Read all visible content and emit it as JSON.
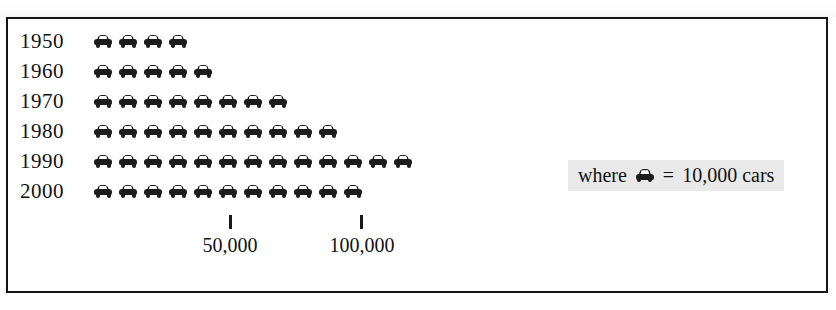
{
  "chart_data": {
    "type": "bar",
    "chart_style": "pictograph",
    "title": "",
    "xlabel": "",
    "ylabel": "",
    "categories": [
      "1950",
      "1960",
      "1970",
      "1980",
      "1990",
      "2000"
    ],
    "values": [
      40000,
      50000,
      80000,
      100000,
      130000,
      110000
    ],
    "icon_counts": [
      4,
      5,
      8,
      10,
      13,
      11
    ],
    "icon_unit_value": 10000,
    "icon_name": "car-icon",
    "axis_ticks": [
      {
        "label": "50,000",
        "value": 50000
      },
      {
        "label": "100,000",
        "value": 100000
      }
    ],
    "xlim": [
      0,
      140000
    ],
    "grid": false,
    "legend": {
      "position": "right",
      "prefix": "where",
      "equals": "=",
      "text": "10,000 cars",
      "full_text": "where  = 10,000 cars"
    },
    "colors": {
      "icon": "#1c1c1c",
      "frame": "#151515",
      "legend_background": "#e9e9e9",
      "background": "#ffffff"
    }
  },
  "rows": [
    {
      "year": "1950",
      "count": 4
    },
    {
      "year": "1960",
      "count": 5
    },
    {
      "year": "1970",
      "count": 8
    },
    {
      "year": "1980",
      "count": 10
    },
    {
      "year": "1990",
      "count": 13
    },
    {
      "year": "2000",
      "count": 11
    }
  ],
  "axis": {
    "tick_1_label": "50,000",
    "tick_2_label": "100,000"
  },
  "legend": {
    "prefix": "where",
    "equals": "=",
    "suffix": "10,000 cars"
  }
}
